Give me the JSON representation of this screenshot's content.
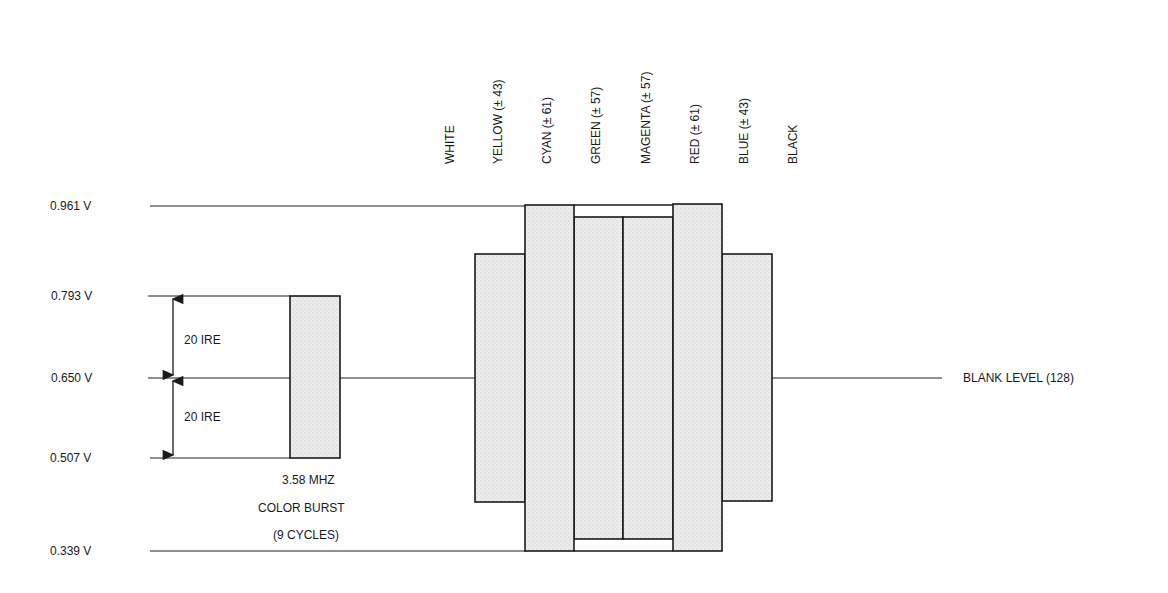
{
  "levels": [
    {
      "label": "0.961 V",
      "y": 206
    },
    {
      "label": "0.793 V",
      "y": 296
    },
    {
      "label": "0.650 V",
      "y": 378
    },
    {
      "label": "0.507 V",
      "y": 458
    },
    {
      "label": "0.339 V",
      "y": 551
    }
  ],
  "ire_labels": [
    "20  IRE",
    "20  IRE"
  ],
  "burst": {
    "line1": "3.58  MHZ",
    "line2": "COLOR  BURST",
    "line3": "(9  CYCLES)"
  },
  "blank_level_label": "BLANK  LEVEL  (128)",
  "bar_labels": [
    "WHITE",
    "YELLOW (± 43)",
    "CYAN (± 61)",
    "GREEN (± 57)",
    "MAGENTA (± 57)",
    "RED (± 61)",
    "BLUE (± 43)",
    "BLACK"
  ],
  "colors": {
    "fill": "#e6e6e6",
    "stroke": "#1a1a1a",
    "background": "#ffffff"
  },
  "chart_data": {
    "type": "bar",
    "title": "",
    "xlabel": "",
    "ylabel": "Voltage",
    "y_ticks": [
      "0.339 V",
      "0.507 V",
      "0.650 V",
      "0.793 V",
      "0.961 V"
    ],
    "ylim_volts": [
      0.339,
      0.961
    ],
    "reference_line": {
      "label": "BLANK LEVEL (128)",
      "volts": 0.65
    },
    "burst": {
      "label": "3.58 MHZ COLOR BURST (9 CYCLES)",
      "min_volts": 0.507,
      "max_volts": 0.793,
      "ire_annotation": "20 IRE above and below blank level"
    },
    "categories": [
      "WHITE",
      "YELLOW",
      "CYAN",
      "GREEN",
      "MAGENTA",
      "RED",
      "BLUE",
      "BLACK"
    ],
    "annotated_amplitude": [
      null,
      43,
      61,
      57,
      57,
      61,
      43,
      null
    ],
    "annotated_amplitude_note": "Amplitudes as printed in the column labels. They do not scale proportionally to the drawn bar heights below.",
    "drawn_extent_px": {
      "blank_y": 378,
      "top_y": [
        null,
        254,
        205,
        217,
        217,
        204,
        254,
        null
      ],
      "bottom_y": [
        null,
        502,
        551,
        539,
        539,
        551,
        501,
        null
      ],
      "note": "Bar extents measured from the pixels. WHITE and BLACK have no bar drawn; the blank-level line continues through them."
    },
    "grid": false,
    "legend": null
  }
}
